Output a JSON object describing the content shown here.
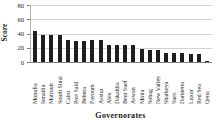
{
  "chart_data": {
    "type": "bar",
    "title": "",
    "xlabel": "Governorates",
    "ylabel": "Score",
    "ylim": [
      0,
      80
    ],
    "yticks": [
      0,
      20,
      40,
      60,
      80
    ],
    "grid": true,
    "legend": "none",
    "bar_color": "#1f1f1f",
    "gridline_color": "#d4d4d4",
    "categories": [
      "Monufia",
      "Ismailia",
      "Matrouh",
      "South Sinai",
      "Cairo",
      "Port Said",
      "Behera",
      "Fayoum",
      "Assiut",
      "Alex",
      "Dakahlia",
      "Beni Suef",
      "Aswan",
      "Minia",
      "Sohag",
      "New Valley",
      "Sharkeya",
      "Suez",
      "Damietta",
      "Luxor",
      "Red Sea",
      "Qena"
    ],
    "values": [
      44,
      38,
      38,
      38,
      31,
      30,
      30,
      31,
      31,
      24,
      24,
      24,
      24,
      18,
      17,
      17,
      12,
      12,
      12,
      11,
      11,
      2
    ]
  }
}
